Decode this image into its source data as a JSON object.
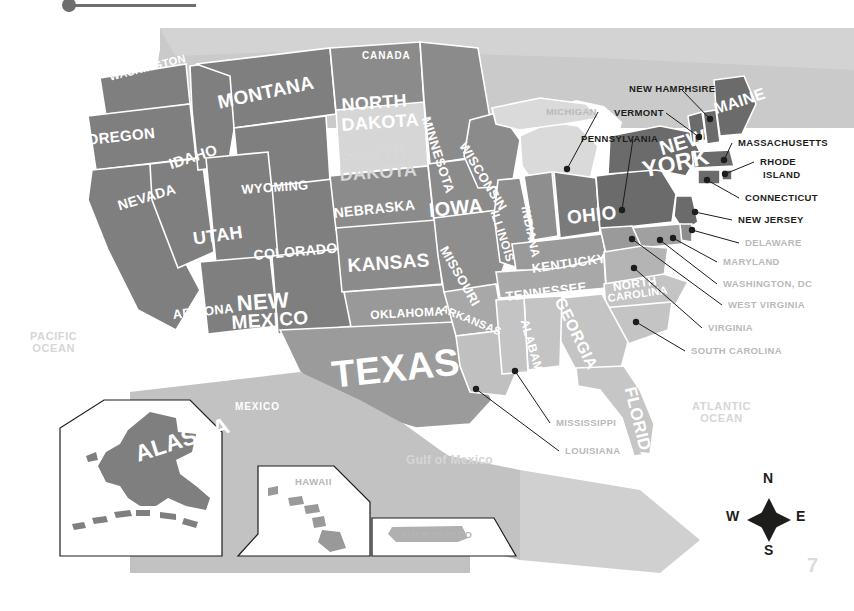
{
  "header": {
    "title": "the United States",
    "pin_icon": "map-pin-icon"
  },
  "page_number": "7",
  "oceans": [
    {
      "name": "PACIFIC OCEAN",
      "line1": "PACIFIC",
      "line2": "OCEAN",
      "x": 30,
      "y": 331
    },
    {
      "name": "ATLANTIC OCEAN",
      "line1": "ATLANTIC",
      "line2": "OCEAN",
      "x": 692,
      "y": 401
    },
    {
      "name": "Gulf of Mexico",
      "line1": "Gulf of Mexico",
      "line2": "",
      "x": 406,
      "y": 454
    }
  ],
  "countries": [
    {
      "label": "CANADA",
      "x": 362,
      "y": 51,
      "size": 10
    },
    {
      "label": "MEXICO",
      "x": 235,
      "y": 402,
      "size": 10
    }
  ],
  "state_labels": [
    {
      "label": "WASHINGTON",
      "x": 108,
      "y": 72,
      "size": 11,
      "rot": -14,
      "tone": "white"
    },
    {
      "label": "OREGON",
      "x": 86,
      "y": 132,
      "size": 15,
      "rot": -6,
      "tone": "white"
    },
    {
      "label": "IDAHO",
      "x": 167,
      "y": 157,
      "size": 15,
      "rot": -18,
      "tone": "white"
    },
    {
      "label": "MONTANA",
      "x": 216,
      "y": 93,
      "size": 19,
      "rot": -12,
      "tone": "white"
    },
    {
      "label": "WYOMING",
      "x": 241,
      "y": 183,
      "size": 13,
      "rot": -4,
      "tone": "white"
    },
    {
      "label": "NEVADA",
      "x": 116,
      "y": 199,
      "size": 14,
      "rot": -17,
      "tone": "white"
    },
    {
      "label": "CALIFORNIA",
      "x": 63,
      "y": 192,
      "size": 18,
      "rot": 72,
      "tone": "white"
    },
    {
      "label": "UTAH",
      "x": 192,
      "y": 230,
      "size": 18,
      "rot": -8,
      "tone": "white"
    },
    {
      "label": "ARIZONA",
      "x": 172,
      "y": 308,
      "size": 13,
      "rot": -6,
      "tone": "white"
    },
    {
      "label": "COLORADO",
      "x": 253,
      "y": 248,
      "size": 14,
      "rot": -5,
      "tone": "white"
    },
    {
      "label": "NEW",
      "x": 236,
      "y": 292,
      "size": 22,
      "rot": -4,
      "tone": "white"
    },
    {
      "label": "MEXICO",
      "x": 231,
      "y": 313,
      "size": 19,
      "rot": -4,
      "tone": "white"
    },
    {
      "label": "NORTH",
      "x": 341,
      "y": 96,
      "size": 18,
      "rot": -4,
      "tone": "white"
    },
    {
      "label": "DAKOTA",
      "x": 341,
      "y": 116,
      "size": 18,
      "rot": -4,
      "tone": "white"
    },
    {
      "label": "SOUTH",
      "x": 341,
      "y": 146,
      "size": 18,
      "rot": -4,
      "tone": "pale"
    },
    {
      "label": "DAKOTA",
      "x": 339,
      "y": 166,
      "size": 18,
      "rot": -4,
      "tone": "pale"
    },
    {
      "label": "NEBRASKA",
      "x": 333,
      "y": 206,
      "size": 14,
      "rot": -6,
      "tone": "white"
    },
    {
      "label": "KANSAS",
      "x": 347,
      "y": 256,
      "size": 19,
      "rot": -4,
      "tone": "white"
    },
    {
      "label": "OKLAHOMA",
      "x": 370,
      "y": 309,
      "size": 12,
      "rot": -3,
      "tone": "white"
    },
    {
      "label": "TEXAS",
      "x": 330,
      "y": 356,
      "size": 38,
      "rot": -6,
      "tone": "white"
    },
    {
      "label": "MINNESOTA",
      "x": 432,
      "y": 115,
      "size": 13,
      "rot": 72,
      "tone": "white"
    },
    {
      "label": "IOWA",
      "x": 428,
      "y": 200,
      "size": 20,
      "rot": -5,
      "tone": "white"
    },
    {
      "label": "MISSOURI",
      "x": 449,
      "y": 244,
      "size": 13,
      "rot": 60,
      "tone": "white"
    },
    {
      "label": "ARKANSAS",
      "x": 443,
      "y": 303,
      "size": 11,
      "rot": 22,
      "tone": "white"
    },
    {
      "label": "LOUISIANA",
      "x": 470,
      "y": 350,
      "size": 10,
      "rot": 0,
      "tone": "hidden"
    },
    {
      "label": "WISCONSIN",
      "x": 468,
      "y": 140,
      "size": 13,
      "rot": 58,
      "tone": "white"
    },
    {
      "label": "ILLINOIS",
      "x": 500,
      "y": 209,
      "size": 12,
      "rot": 72,
      "tone": "white"
    },
    {
      "label": "INDIANA",
      "x": 531,
      "y": 205,
      "size": 12,
      "rot": 78,
      "tone": "white"
    },
    {
      "label": "OHIO",
      "x": 566,
      "y": 208,
      "size": 19,
      "rot": -6,
      "tone": "white"
    },
    {
      "label": "KENTUCKY",
      "x": 531,
      "y": 262,
      "size": 13,
      "rot": -8,
      "tone": "white"
    },
    {
      "label": "TENNESSEE",
      "x": 505,
      "y": 290,
      "size": 13,
      "rot": -7,
      "tone": "white"
    },
    {
      "label": "MISSISSIPPI",
      "x": 500,
      "y": 333,
      "size": 10,
      "rot": 0,
      "tone": "hidden"
    },
    {
      "label": "ALABAMA",
      "x": 530,
      "y": 318,
      "size": 12,
      "rot": 74,
      "tone": "white"
    },
    {
      "label": "GEORGIA",
      "x": 566,
      "y": 295,
      "size": 16,
      "rot": 64,
      "tone": "white"
    },
    {
      "label": "FLORIDA",
      "x": 638,
      "y": 385,
      "size": 17,
      "rot": 76,
      "tone": "white"
    },
    {
      "label": "NORTH",
      "x": 612,
      "y": 281,
      "size": 12,
      "rot": -8,
      "tone": "white"
    },
    {
      "label": "CAROLINA",
      "x": 607,
      "y": 293,
      "size": 11,
      "rot": -8,
      "tone": "white"
    },
    {
      "label": "NEW",
      "x": 657,
      "y": 139,
      "size": 20,
      "rot": -16,
      "tone": "white"
    },
    {
      "label": "YORK",
      "x": 640,
      "y": 158,
      "size": 23,
      "rot": -12,
      "tone": "white"
    },
    {
      "label": "MAINE",
      "x": 712,
      "y": 102,
      "size": 16,
      "rot": -18,
      "tone": "white"
    },
    {
      "label": "ALASKA",
      "x": 132,
      "y": 443,
      "size": 23,
      "rot": -18,
      "tone": "white"
    }
  ],
  "callouts": [
    {
      "name": "michigan",
      "label": "MICHIGAN",
      "lx": 546,
      "ly": 107,
      "px": 567,
      "py": 169,
      "tone": "pale"
    },
    {
      "name": "new-hampshire",
      "label": "NEW HAMPHSIRE",
      "lx": 629,
      "ly": 84,
      "px": 710,
      "py": 119,
      "tone": "dark"
    },
    {
      "name": "vermont",
      "label": "VERMONT",
      "lx": 614,
      "ly": 108,
      "px": 699,
      "py": 137,
      "tone": "dark"
    },
    {
      "name": "pennsylvania",
      "label": "PENNSYLVANIA",
      "lx": 581,
      "ly": 134,
      "px": 622,
      "py": 210,
      "tone": "dark"
    },
    {
      "name": "massachusetts",
      "label": "MASSACHUSETTS",
      "lx": 738,
      "ly": 138,
      "px": 724,
      "py": 160,
      "tone": "dark"
    },
    {
      "name": "rhode-island-1",
      "label": "RHODE",
      "lx": 760,
      "ly": 157,
      "px": 725,
      "py": 174,
      "tone": "dark"
    },
    {
      "name": "rhode-island-2",
      "label": "ISLAND",
      "lx": 763,
      "ly": 170,
      "px": 0,
      "py": 0,
      "tone": "dark"
    },
    {
      "name": "connecticut",
      "label": "CONNECTICUT",
      "lx": 745,
      "ly": 193,
      "px": 707,
      "py": 180,
      "tone": "dark"
    },
    {
      "name": "new-jersey",
      "label": "NEW JERSEY",
      "lx": 738,
      "ly": 215,
      "px": 695,
      "py": 212,
      "tone": "dark"
    },
    {
      "name": "delaware",
      "label": "DELAWARE",
      "lx": 745,
      "ly": 238,
      "px": 692,
      "py": 230,
      "tone": "pale"
    },
    {
      "name": "maryland",
      "label": "MARYLAND",
      "lx": 723,
      "ly": 257,
      "px": 673,
      "py": 238,
      "tone": "pale"
    },
    {
      "name": "washington-dc",
      "label": "WASHINGTON, DC",
      "lx": 723,
      "ly": 279,
      "px": 660,
      "py": 240,
      "tone": "pale"
    },
    {
      "name": "west-virginia",
      "label": "WEST VIRGINIA",
      "lx": 728,
      "ly": 300,
      "px": 632,
      "py": 239,
      "tone": "pale"
    },
    {
      "name": "virginia",
      "label": "VIRGINIA",
      "lx": 708,
      "ly": 323,
      "px": 634,
      "py": 268,
      "tone": "pale"
    },
    {
      "name": "south-carolina",
      "label": "SOUTH CAROLINA",
      "lx": 691,
      "ly": 346,
      "px": 636,
      "py": 322,
      "tone": "pale"
    },
    {
      "name": "mississippi",
      "label": "MISSISSIPPI",
      "lx": 556,
      "ly": 418,
      "px": 515,
      "py": 371,
      "tone": "pale"
    },
    {
      "name": "louisiana",
      "label": "LOUISIANA",
      "lx": 565,
      "ly": 446,
      "px": 476,
      "py": 389,
      "tone": "pale"
    }
  ],
  "insets": [
    {
      "name": "alaska",
      "label": "ALASKA",
      "lx": 0,
      "ly": 0
    },
    {
      "name": "hawaii",
      "label": "HAWAII",
      "lx": 295,
      "ly": 477
    },
    {
      "name": "puerto-rico",
      "label": "PUERTO RICO",
      "lx": 401,
      "ly": 530
    }
  ],
  "compass": {
    "n": "N",
    "s": "S",
    "e": "E",
    "w": "W"
  },
  "colors": {
    "land_west": "#808080",
    "land_mid": "#8e8e8e",
    "land_east": "#6b6b6b",
    "land_south": "#c6c6c6",
    "land_pale": "#d2d2d2",
    "highlight": "#d9d9d9",
    "canada": "#c9c9c9",
    "mexico": "#c2c2c2",
    "ocean_text": "#d6d6d6",
    "callout_dark": "#1d1d1b",
    "callout_pale": "#b9b9b9",
    "page_number": "#dcdcdc"
  }
}
